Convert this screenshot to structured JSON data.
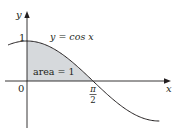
{
  "chart_data": {
    "type": "area",
    "title": "",
    "function": "y = cos x",
    "xlabel": "x",
    "ylabel": "y",
    "x_ticks": [
      {
        "value": 0,
        "label": "0"
      },
      {
        "value": 1.5708,
        "label": "π/2"
      }
    ],
    "y_ticks": [
      {
        "value": 1,
        "label": "1"
      }
    ],
    "xlim": [
      -0.5,
      3.4
    ],
    "ylim": [
      -1.1,
      1.7
    ],
    "grid": false,
    "legend": null,
    "series": [
      {
        "name": "y = cos x",
        "x": [
          -0.5,
          0,
          0.5,
          1.0,
          1.5708,
          2.0,
          2.5,
          3.0,
          3.1416
        ],
        "values": [
          0.878,
          1.0,
          0.878,
          0.54,
          0.0,
          -0.416,
          -0.801,
          -0.99,
          -1.0
        ]
      }
    ],
    "shaded_region": {
      "from": 0,
      "to": 1.5708,
      "label": "area = 1",
      "value": 1
    },
    "annotations": [
      {
        "text": "y = cos x",
        "near": "curve top"
      },
      {
        "text": "area = 1",
        "near": "shaded region"
      }
    ]
  },
  "labels": {
    "y_axis": "y",
    "x_axis": "x",
    "origin": "0",
    "y_one": "1",
    "pi_num": "π",
    "pi_den": "2",
    "curve": "y = cos x",
    "area": "area = 1"
  },
  "colors": {
    "shade": "#d6d9dc",
    "curve": "#231f20",
    "axis": "#231f20"
  }
}
